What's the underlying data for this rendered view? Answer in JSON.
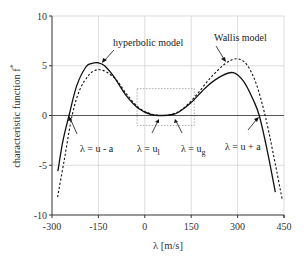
{
  "chart_data": {
    "type": "line",
    "title": "",
    "xlabel": "λ [m/s]",
    "ylabel": "characteristic function f*",
    "xlim": [
      -300,
      450
    ],
    "ylim": [
      -10,
      10
    ],
    "xticks": [
      -300,
      -150,
      0,
      150,
      300,
      450
    ],
    "yticks": [
      -10,
      -5,
      0,
      5,
      10
    ],
    "xtick_labels": [
      "-300",
      "-150",
      "0",
      "150",
      "300",
      "450"
    ],
    "ytick_labels": [
      "-10",
      "-5",
      "0",
      "5",
      "10"
    ],
    "grid": true,
    "series": [
      {
        "name": "hyperbolic model",
        "style": "solid",
        "x": [
          -281,
          -265,
          -245,
          -220,
          -190,
          -170,
          -151,
          -130,
          -100,
          -60,
          -20,
          20,
          60,
          90,
          110,
          150,
          200,
          250,
          286,
          320,
          350,
          370,
          395,
          422
        ],
        "y": [
          -5.6,
          -2.6,
          0.0,
          3.0,
          4.9,
          5.25,
          5.3,
          5.0,
          3.9,
          2.0,
          0.7,
          0.1,
          0.0,
          0.1,
          0.35,
          1.3,
          2.9,
          4.0,
          4.3,
          3.4,
          1.6,
          0.0,
          -3.4,
          -7.7
        ]
      },
      {
        "name": "Wallis model",
        "style": "dashed",
        "x": [
          -282,
          -260,
          -235,
          -210,
          -180,
          -160,
          -145,
          -120,
          -90,
          -60,
          -20,
          20,
          60,
          90,
          120,
          160,
          210,
          260,
          298,
          330,
          360,
          389,
          415,
          444
        ],
        "y": [
          -8.2,
          -4.4,
          0.0,
          2.6,
          4.1,
          4.55,
          4.6,
          4.3,
          3.5,
          2.2,
          0.8,
          0.15,
          0.0,
          0.15,
          0.6,
          1.8,
          3.7,
          5.2,
          5.7,
          5.1,
          3.2,
          0.0,
          -3.8,
          -8.4
        ]
      }
    ],
    "annotations": [
      {
        "text": "hyperbolic model",
        "points_to": [
          -151,
          5.3
        ]
      },
      {
        "text": "Wallis model",
        "points_to": [
          255,
          5.3
        ]
      },
      {
        "text_main": "λ = u - a",
        "points_to": [
          -245,
          0
        ]
      },
      {
        "text_main": "λ = u",
        "sub": "l",
        "points_to": [
          50,
          0
        ]
      },
      {
        "text_main": "λ = u",
        "sub": "g",
        "points_to": [
          95,
          0
        ]
      },
      {
        "text_main": "λ = u + a",
        "points_to": [
          370,
          0
        ]
      }
    ],
    "zoom_box": {
      "x": [
        -25,
        160
      ],
      "y": [
        -1,
        2.7
      ]
    }
  },
  "labels": {
    "xlabel": "λ [m/s]",
    "ylabel": "characteristic function f",
    "ylabel_sup": "*",
    "hyperbolic": "hyperbolic model",
    "wallis": "Wallis model",
    "u_minus_a": "λ = u - a",
    "u_l_main": "λ = u",
    "u_l_sub": "l",
    "u_g_main": "λ = u",
    "u_g_sub": "g",
    "u_plus_a": "λ = u + a"
  }
}
